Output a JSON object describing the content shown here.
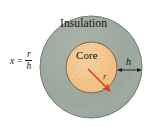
{
  "figure": {
    "name": "insulated-core-cross-section",
    "background": "#ffffff",
    "width": 152,
    "height": 130
  },
  "formula": {
    "variable": "x",
    "equals": "=",
    "numerator": "r",
    "denominator": "h"
  },
  "labels": {
    "insulation": "Insulation",
    "core": "Core",
    "thickness": "h",
    "radius": "r"
  },
  "colors": {
    "insulation_fill": "#9ba79c",
    "insulation_stroke": "#6e7a70",
    "core_fill": "#f2c286",
    "core_stroke": "#7a5f34",
    "radius_arrow": "#d94018",
    "thickness_arrow": "#1a1a1a",
    "text": "#141414"
  },
  "geometry": {
    "outer_center_x": 91,
    "outer_center_y": 67,
    "outer_radius": 51,
    "core_center_x": 91.5,
    "core_center_y": 67.5,
    "core_radius": 25.5,
    "radius_arrow_from": [
      88,
      70
    ],
    "radius_arrow_to": [
      111,
      92
    ],
    "thickness_arrow_from": [
      117,
      70
    ],
    "thickness_arrow_to": [
      142,
      70
    ]
  }
}
